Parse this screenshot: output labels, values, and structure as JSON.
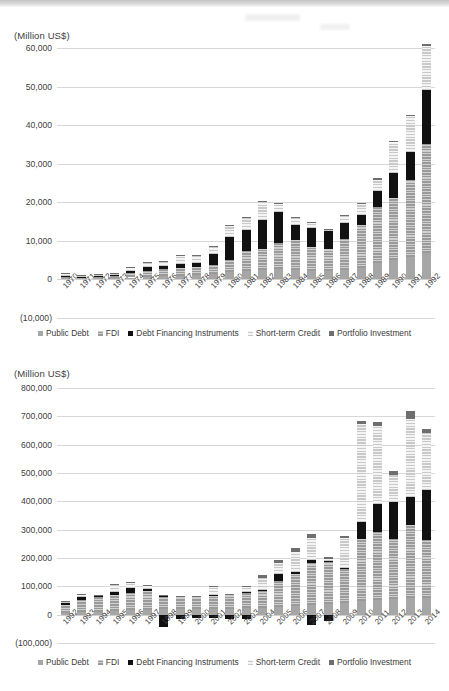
{
  "figure": {
    "unit_label": "(Million US$)"
  },
  "legend": {
    "items": [
      {
        "label": "Public Debt",
        "key": "public",
        "color": "#a6a6a6"
      },
      {
        "label": "FDI",
        "key": "fdi",
        "color": "#b4b4b4"
      },
      {
        "label": "Debt Financing Instruments",
        "key": "debtfin",
        "color": "#111111"
      },
      {
        "label": "Short-term Credit",
        "key": "stcredit",
        "color": "#d9d9d9"
      },
      {
        "label": "Portfolio Investment",
        "key": "portfolio",
        "color": "#6e6e6e"
      }
    ]
  },
  "chart_data": [
    {
      "type": "bar",
      "stacked": true,
      "title": "",
      "xlabel": "",
      "ylabel": "(Million US$)",
      "ylim": [
        -10000,
        60000
      ],
      "ytick_labels": [
        "60,000",
        "50,000",
        "40,000",
        "30,000",
        "20,000",
        "10,000",
        "0",
        "(10,000)"
      ],
      "yticks": [
        60000,
        50000,
        40000,
        30000,
        20000,
        10000,
        0,
        -10000
      ],
      "grid": true,
      "legend_position": "bottom",
      "categories": [
        "1970",
        "1971",
        "1972",
        "1973",
        "1974",
        "1975",
        "1976",
        "1977",
        "1978",
        "1979",
        "1980",
        "1981",
        "1982",
        "1983",
        "1984",
        "1985",
        "1986",
        "1987",
        "1988",
        "1989",
        "1990",
        "1991",
        "1992"
      ],
      "series": [
        {
          "name": "Public Debt",
          "values": [
            300,
            250,
            300,
            350,
            500,
            700,
            900,
            1000,
            1100,
            1300,
            1800,
            2200,
            2500,
            2700,
            2500,
            2300,
            2100,
            2400,
            3000,
            4200,
            5000,
            5800,
            6800
          ]
        },
        {
          "name": "FDI",
          "values": [
            600,
            400,
            600,
            700,
            1100,
            1600,
            1700,
            1900,
            2000,
            2400,
            3300,
            5100,
            5400,
            6800,
            7600,
            6200,
            5900,
            8200,
            11000,
            14500,
            16200,
            20100,
            28200
          ]
        },
        {
          "name": "Debt Financing Instruments",
          "values": [
            100,
            100,
            100,
            100,
            600,
            900,
            900,
            1000,
            1100,
            3000,
            5800,
            5500,
            7500,
            8000,
            3900,
            4900,
            4500,
            4000,
            2800,
            4300,
            6300,
            7100,
            14000
          ]
        },
        {
          "name": "Short-term Credit",
          "values": [
            400,
            200,
            300,
            300,
            800,
            1100,
            1200,
            2300,
            1900,
            1700,
            3000,
            3100,
            4800,
            2200,
            2100,
            1200,
            300,
            2000,
            2700,
            2900,
            8000,
            9400,
            11600
          ]
        },
        {
          "name": "Portfolio Investment",
          "values": [
            200,
            100,
            200,
            200,
            200,
            200,
            200,
            200,
            200,
            200,
            200,
            200,
            200,
            200,
            200,
            200,
            200,
            200,
            200,
            300,
            300,
            300,
            500
          ]
        }
      ]
    },
    {
      "type": "bar",
      "stacked": true,
      "title": "",
      "xlabel": "",
      "ylabel": "(Million US$)",
      "ylim": [
        -100000,
        800000
      ],
      "ytick_labels": [
        "800,000",
        "700,000",
        "600,000",
        "500,000",
        "400,000",
        "300,000",
        "200,000",
        "100,000",
        "0",
        "(100,000)"
      ],
      "yticks": [
        800000,
        700000,
        600000,
        500000,
        400000,
        300000,
        200000,
        100000,
        0,
        -100000
      ],
      "grid": true,
      "legend_position": "bottom",
      "categories": [
        "1992",
        "1993",
        "1994",
        "1995",
        "1996",
        "1997",
        "1998",
        "1999",
        "2000",
        "2001",
        "2002",
        "2003",
        "2004",
        "2005",
        "2006",
        "2007",
        "2008",
        "2009",
        "2010",
        "2011",
        "2012",
        "2013",
        "2014"
      ],
      "series": [
        {
          "name": "Public Debt",
          "values": [
            7000,
            9000,
            11000,
            13000,
            15000,
            17000,
            19000,
            20000,
            20000,
            21000,
            21000,
            22000,
            24000,
            27000,
            30000,
            34000,
            38000,
            42000,
            48000,
            52000,
            56000,
            58000,
            60000
          ]
        },
        {
          "name": "FDI",
          "values": [
            28000,
            44000,
            50000,
            58000,
            60000,
            65000,
            45000,
            40000,
            40000,
            45000,
            45000,
            55000,
            58000,
            93000,
            115000,
            148000,
            148000,
            120000,
            220000,
            240000,
            210000,
            258000,
            205000
          ]
        },
        {
          "name": "Debt Financing Instruments",
          "values": [
            6000,
            9000,
            6000,
            8000,
            18000,
            8000,
            2000,
            2000,
            2000,
            2000,
            2000,
            2000,
            5000,
            25000,
            5000,
            10000,
            4000,
            4000,
            60000,
            100000,
            130000,
            100000,
            175000
          ]
        },
        {
          "name": "Short-term Credit",
          "values": [
            5000,
            8000,
            2000,
            28000,
            20000,
            13000,
            2000,
            2000,
            2000,
            33000,
            3000,
            20000,
            42000,
            36000,
            72000,
            78000,
            6000,
            105000,
            345000,
            275000,
            98000,
            275000,
            200000
          ]
        },
        {
          "name": "Portfolio Investment",
          "values": [
            2000,
            3000,
            2000,
            2000,
            2000,
            2000,
            1000,
            1000,
            1000,
            1000,
            1000,
            1000,
            10000,
            11000,
            14000,
            15000,
            9000,
            7000,
            12000,
            14000,
            13000,
            28000,
            14000
          ]
        },
        {
          "name": "Negative",
          "values": [
            0,
            0,
            0,
            0,
            0,
            0,
            -45000,
            -14000,
            -13000,
            -12000,
            -15000,
            -14000,
            0,
            0,
            0,
            -37000,
            -22000,
            0,
            0,
            0,
            0,
            0,
            0
          ]
        }
      ]
    }
  ]
}
